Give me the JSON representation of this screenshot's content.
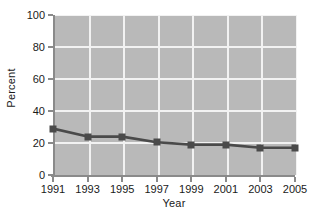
{
  "chart_data": {
    "type": "line",
    "title": "",
    "xlabel": "Year",
    "ylabel": "Percent",
    "categories": [
      "1991",
      "1993",
      "1995",
      "1997",
      "1999",
      "2001",
      "2003",
      "2005"
    ],
    "x": [
      1991,
      1993,
      1995,
      1997,
      1999,
      2001,
      2003,
      2005
    ],
    "values": [
      29,
      24,
      24,
      20.5,
      19,
      19,
      17,
      17
    ],
    "series": [
      {
        "name": "Percent",
        "values": [
          29,
          24,
          24,
          20.5,
          19,
          19,
          17,
          17
        ]
      }
    ],
    "ylim": [
      0,
      100
    ],
    "yticks": [
      0,
      20,
      40,
      60,
      80,
      100
    ],
    "ytick_labels": [
      "0",
      "20",
      "40",
      "60",
      "80",
      "100"
    ],
    "xtick_labels": [
      "1991",
      "1993",
      "1995",
      "1997",
      "1999",
      "2001",
      "2003",
      "2005"
    ],
    "grid": true,
    "grid_color": "#f2f2f2",
    "legend": false,
    "legend_position": "none",
    "plot_background": "#b9b9b9",
    "figure_background": "#ffffff",
    "line_color": "#4a4a4a",
    "marker_color": "#4a4a4a",
    "marker_shape": "square",
    "axis_color": "#8a8a8a",
    "text_color": "#1a1a1a"
  }
}
